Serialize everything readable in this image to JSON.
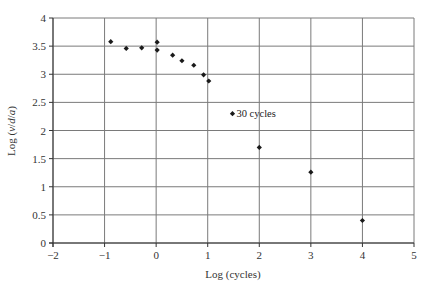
{
  "chart_data": {
    "type": "scatter",
    "title": "",
    "xlabel": "Log (cycles)",
    "ylabel_parts": [
      "Log (",
      "v",
      "/",
      "d",
      "/",
      "a",
      ")"
    ],
    "ylabel": "Log (v/d/a)",
    "xlim": [
      -2,
      5
    ],
    "ylim": [
      0,
      4
    ],
    "xticks": [
      -2,
      -1,
      0,
      1,
      2,
      3,
      4,
      5
    ],
    "xtick_labels": [
      "−2",
      "−1",
      "0",
      "1",
      "2",
      "3",
      "4",
      "5"
    ],
    "yticks": [
      0,
      0.5,
      1,
      1.5,
      2,
      2.5,
      3,
      3.5,
      4
    ],
    "ytick_labels": [
      "0",
      "0.5",
      "1",
      "1.5",
      "2",
      "2.5",
      "3",
      "3.5",
      "4"
    ],
    "grid": true,
    "legend": null,
    "marker": "diamond",
    "marker_color": "#1a1a1a",
    "series": [
      {
        "name": "data",
        "points": [
          {
            "x": -0.88,
            "y": 3.58
          },
          {
            "x": -0.58,
            "y": 3.46
          },
          {
            "x": -0.28,
            "y": 3.47
          },
          {
            "x": 0.02,
            "y": 3.57
          },
          {
            "x": 0.02,
            "y": 3.43
          },
          {
            "x": 0.32,
            "y": 3.34
          },
          {
            "x": 0.5,
            "y": 3.24
          },
          {
            "x": 0.73,
            "y": 3.16
          },
          {
            "x": 0.92,
            "y": 2.99
          },
          {
            "x": 1.02,
            "y": 2.88
          },
          {
            "x": 1.48,
            "y": 2.3
          },
          {
            "x": 2.0,
            "y": 1.7
          },
          {
            "x": 3.0,
            "y": 1.26
          },
          {
            "x": 4.0,
            "y": 0.4
          }
        ]
      }
    ],
    "annotations": [
      {
        "text": "30 cycles",
        "x": 1.48,
        "y": 2.3
      }
    ]
  },
  "layout": {
    "plot_left": 53,
    "plot_right": 414,
    "plot_top": 18,
    "plot_bottom": 243
  }
}
